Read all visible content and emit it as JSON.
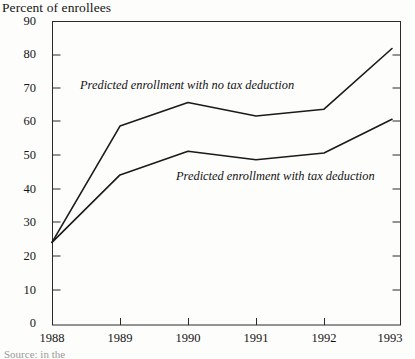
{
  "figure": {
    "axis_title": "Percent of enrollees",
    "source_note": "Source: in the",
    "ink_color": "#1a1a1a",
    "paper_color": "#fdfdfc"
  },
  "chart_data": {
    "type": "line",
    "title": "Percent of enrollees",
    "xlabel": "",
    "ylabel": "Percent of enrollees",
    "x": [
      "1988",
      "1989",
      "1990",
      "1991",
      "1992",
      "1993"
    ],
    "xlim": [
      1988,
      1993
    ],
    "ylim": [
      0,
      90
    ],
    "ytick_labels": [
      "0",
      "10",
      "20",
      "30",
      "40",
      "50",
      "60",
      "70",
      "80",
      "90"
    ],
    "yticks": [
      0,
      10,
      20,
      30,
      40,
      50,
      60,
      70,
      80,
      90
    ],
    "xtick_labels": [
      "1988",
      "1989",
      "1990",
      "1991",
      "1992",
      "1993"
    ],
    "grid": false,
    "legend_position": "inline-annotations",
    "series": [
      {
        "name": "Predicted enrollment with no tax deduction",
        "values": [
          24.5,
          59,
          66,
          62,
          64,
          82
        ]
      },
      {
        "name": "Predicted enrollment with tax deduction",
        "values": [
          24.5,
          44.5,
          51.5,
          49,
          51,
          61
        ]
      }
    ],
    "annotations": [
      {
        "text": "Predicted enrollment with no tax deduction",
        "series": "Predicted enrollment with no tax deduction"
      },
      {
        "text": "Predicted enrollment with tax deduction",
        "series": "Predicted enrollment with tax deduction"
      }
    ]
  },
  "y_axis": {
    "ticks": [
      {
        "label": "90",
        "top": 15
      },
      {
        "label": "80",
        "top": 48
      },
      {
        "label": "70",
        "top": 82
      },
      {
        "label": "60",
        "top": 115
      },
      {
        "label": "50",
        "top": 149
      },
      {
        "label": "40",
        "top": 183
      },
      {
        "label": "30",
        "top": 216
      },
      {
        "label": "20",
        "top": 250
      },
      {
        "label": "10",
        "top": 284
      },
      {
        "label": "0",
        "top": 317
      }
    ]
  },
  "x_axis": {
    "ticks": [
      {
        "label": "1988",
        "left": 22
      },
      {
        "label": "1989",
        "left": 90
      },
      {
        "label": "1990",
        "left": 158
      },
      {
        "label": "1991",
        "left": 226
      },
      {
        "label": "1992",
        "left": 294
      },
      {
        "label": "1993",
        "left": 360
      }
    ]
  }
}
